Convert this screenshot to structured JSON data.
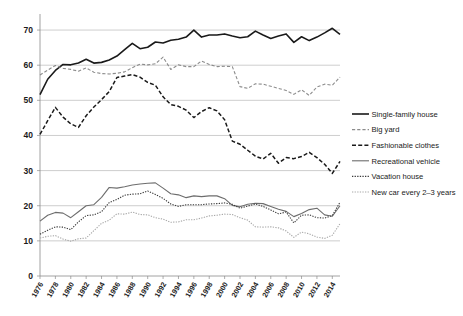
{
  "chart_data": {
    "type": "line",
    "title": "",
    "xlabel": "",
    "ylabel": "",
    "xlim": [
      1976,
      2015
    ],
    "ylim": [
      0,
      74
    ],
    "yticks": [
      0,
      10,
      20,
      30,
      40,
      50,
      60,
      70
    ],
    "grid": "horizontal",
    "legend_position": "right",
    "x": [
      1976,
      1977,
      1978,
      1979,
      1980,
      1981,
      1982,
      1983,
      1984,
      1985,
      1986,
      1987,
      1988,
      1989,
      1990,
      1991,
      1992,
      1993,
      1994,
      1995,
      1996,
      1997,
      1998,
      1999,
      2000,
      2001,
      2002,
      2003,
      2004,
      2005,
      2006,
      2007,
      2008,
      2009,
      2010,
      2011,
      2012,
      2013,
      2014,
      2015
    ],
    "xtick_labels": [
      "1976",
      "1978",
      "1980",
      "1982",
      "1984",
      "1986",
      "1988",
      "1990",
      "1992",
      "1994",
      "1996",
      "1998",
      "2000",
      "2002",
      "2004",
      "2006",
      "2008",
      "2010",
      "2012",
      "2014"
    ],
    "series": [
      {
        "name": "Single-family house",
        "style": "solid",
        "color": "#1a1a1a",
        "width": 1.6,
        "values": [
          51.6,
          56.0,
          58.5,
          60.2,
          60.1,
          60.6,
          61.7,
          60.6,
          60.8,
          61.5,
          62.6,
          64.4,
          66.2,
          64.7,
          65.1,
          66.6,
          66.3,
          67.1,
          67.4,
          68.0,
          70.0,
          68.0,
          68.6,
          68.6,
          68.9,
          68.3,
          67.8,
          68.1,
          69.7,
          68.6,
          67.6,
          68.3,
          68.9,
          66.5,
          68.1,
          67.0,
          68.0,
          69.2,
          70.5,
          68.8
        ]
      },
      {
        "name": "Big yard",
        "style": "dashed",
        "color": "#8c8c8c",
        "width": 1.1,
        "values": [
          57.2,
          58.6,
          59.9,
          59.1,
          58.8,
          58.3,
          59.2,
          58.0,
          57.6,
          57.5,
          57.7,
          58.1,
          59.3,
          60.3,
          60.1,
          60.4,
          62.3,
          58.8,
          60.1,
          59.6,
          59.6,
          61.2,
          60.2,
          59.6,
          59.7,
          59.6,
          53.9,
          53.4,
          54.7,
          54.6,
          54.0,
          53.4,
          52.8,
          51.7,
          53.0,
          51.4,
          53.8,
          54.6,
          54.3,
          56.6
        ]
      },
      {
        "name": "Fashionable clothes",
        "style": "dashed-heavy",
        "color": "#1a1a1a",
        "width": 1.5,
        "values": [
          40.3,
          44.2,
          48.0,
          45.2,
          43.3,
          42.3,
          45.6,
          48.1,
          50.2,
          52.5,
          56.5,
          56.9,
          57.3,
          56.6,
          55.1,
          54.3,
          51.0,
          48.8,
          48.3,
          47.2,
          45.1,
          46.8,
          47.9,
          47.0,
          44.5,
          38.4,
          37.5,
          35.8,
          34.1,
          33.3,
          34.9,
          32.1,
          33.7,
          33.4,
          34.0,
          35.2,
          33.7,
          31.8,
          29.2,
          32.6
        ]
      },
      {
        "name": "Recreational vehicle",
        "style": "solid",
        "color": "#6d6d6d",
        "width": 1.1,
        "values": [
          15.6,
          17.3,
          18.1,
          17.9,
          16.6,
          18.3,
          20.0,
          20.3,
          22.4,
          25.2,
          25.0,
          25.4,
          25.9,
          26.2,
          26.4,
          26.5,
          25.0,
          23.4,
          23.1,
          22.3,
          22.8,
          22.6,
          22.8,
          22.8,
          22.0,
          20.1,
          19.7,
          20.4,
          20.7,
          20.6,
          19.8,
          19.0,
          18.4,
          16.9,
          17.8,
          18.9,
          19.3,
          17.4,
          17.0,
          20.0
        ]
      },
      {
        "name": "Vacation house",
        "style": "dotted",
        "color": "#3a3a3a",
        "width": 1.1,
        "values": [
          11.9,
          13.0,
          14.0,
          13.9,
          13.2,
          15.4,
          17.2,
          17.4,
          18.3,
          20.9,
          21.8,
          23.0,
          23.3,
          23.4,
          24.2,
          23.2,
          22.1,
          20.5,
          19.8,
          20.3,
          20.3,
          20.3,
          20.5,
          20.6,
          20.8,
          20.4,
          19.3,
          19.9,
          20.5,
          19.8,
          18.8,
          17.7,
          18.2,
          15.1,
          17.3,
          17.4,
          16.6,
          16.5,
          17.2,
          21.0
        ]
      },
      {
        "name": "New car every 2–3 years",
        "style": "dotted",
        "color": "#a8a8a8",
        "width": 1.1,
        "values": [
          10.8,
          11.3,
          11.5,
          10.5,
          9.9,
          10.6,
          10.8,
          12.9,
          15.0,
          15.9,
          17.7,
          17.6,
          18.2,
          17.5,
          17.4,
          16.6,
          16.2,
          15.3,
          15.4,
          16.0,
          16.0,
          16.5,
          17.1,
          17.3,
          17.6,
          17.5,
          16.6,
          15.9,
          14.0,
          13.9,
          14.0,
          13.7,
          12.8,
          11.0,
          12.5,
          12.0,
          11.1,
          10.7,
          11.6,
          14.9
        ]
      }
    ],
    "legend_entries": [
      {
        "label": "Single-family house"
      },
      {
        "label": "Big yard"
      },
      {
        "label": "Fashionable clothes"
      },
      {
        "label": "Recreational vehicle"
      },
      {
        "label": "Vacation house"
      },
      {
        "label": "New car every 2–3 years"
      }
    ]
  }
}
